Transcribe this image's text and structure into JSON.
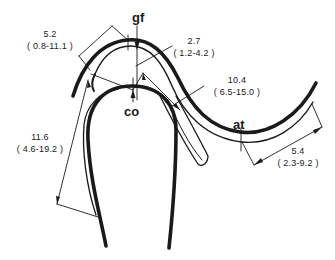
{
  "diagram": {
    "type": "anatomical-measurement-drawing",
    "colors": {
      "stroke": "#1a1a1a",
      "background": "#ffffff"
    },
    "point_labels": {
      "gf": "gf",
      "co": "co",
      "at": "at"
    },
    "measurements": [
      {
        "id": "m1",
        "value": "5.2",
        "range": "( 0.8-11.1 )"
      },
      {
        "id": "m2",
        "value": "2.7",
        "range": "( 1.2-4.2 )"
      },
      {
        "id": "m3",
        "value": "10.4",
        "range": "( 6.5-15.0 )"
      },
      {
        "id": "m4",
        "value": "11.6",
        "range": "( 4.6-19.2 )"
      },
      {
        "id": "m5",
        "value": "5.4",
        "range": "( 2.3-9.2 )"
      }
    ]
  }
}
